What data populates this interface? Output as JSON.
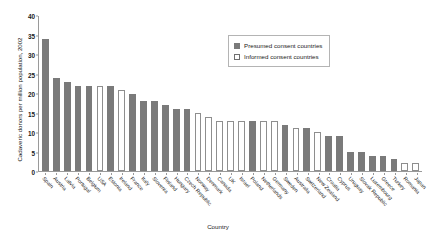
{
  "chart_data": {
    "type": "bar",
    "title": "",
    "xlabel": "Country",
    "ylabel": "Cadaveric donors per million population, 2002",
    "ylim": [
      0,
      40
    ],
    "ytick_step": 5,
    "yticks": [
      "0",
      "5",
      "10",
      "15",
      "20",
      "25",
      "30",
      "35",
      "40"
    ],
    "grid": false,
    "legend_position": "top-right",
    "categories": [
      "Spain",
      "Austria",
      "Latvia",
      "Portugal",
      "Belgium",
      "USA",
      "Estonia",
      "Ireland",
      "France",
      "Italy",
      "Slovenia",
      "Finland",
      "Hungary",
      "Czech Republic",
      "Norway",
      "Denmark",
      "Canada",
      "UK",
      "Israel",
      "Poland",
      "Netherlands",
      "Germany",
      "Sweden",
      "Australia",
      "Switzerland",
      "New Zealand",
      "Croatia",
      "Cyprus",
      "Uruguay",
      "Slovak Republic",
      "Luxembourg",
      "Greece",
      "Turkey",
      "Romania",
      "Japan"
    ],
    "values": [
      34,
      24,
      23,
      22,
      22,
      22,
      22,
      21,
      20,
      18,
      18,
      17,
      16,
      16,
      15,
      14,
      13,
      13,
      13,
      13,
      13,
      13,
      12,
      11,
      11,
      10,
      9,
      9,
      5,
      5,
      4,
      4,
      3,
      2,
      2
    ],
    "consent_type": [
      "presumed",
      "presumed",
      "presumed",
      "presumed",
      "presumed",
      "informed",
      "presumed",
      "informed",
      "presumed",
      "presumed",
      "presumed",
      "presumed",
      "presumed",
      "presumed",
      "informed",
      "informed",
      "informed",
      "informed",
      "informed",
      "presumed",
      "informed",
      "informed",
      "presumed",
      "informed",
      "presumed",
      "informed",
      "presumed",
      "presumed",
      "presumed",
      "presumed",
      "presumed",
      "presumed",
      "presumed",
      "informed",
      "informed"
    ],
    "series": [
      {
        "name": "Presumed consent countries",
        "key": "presumed",
        "color": "#7a7a7a"
      },
      {
        "name": "Informed consent countries",
        "key": "informed",
        "color": "#ffffff"
      }
    ]
  },
  "legend": {
    "items": [
      {
        "label": "Presumed consent countries",
        "key": "presumed"
      },
      {
        "label": "Informed consent countries",
        "key": "informed"
      }
    ]
  },
  "colors": {
    "presumed_fill": "#7a7a7a",
    "informed_fill": "#ffffff",
    "informed_stroke": "#8e8e8e",
    "axis": "#9a9a9a",
    "text": "#1a1a1a",
    "legend_border": "#b4b4b4",
    "background": "#ffffff"
  }
}
